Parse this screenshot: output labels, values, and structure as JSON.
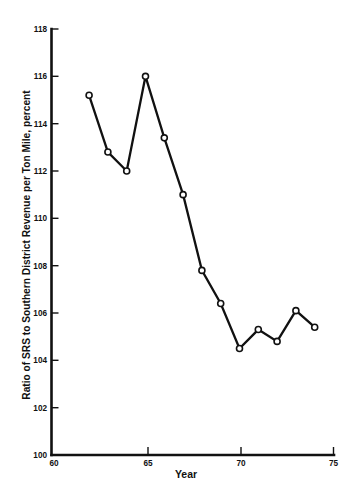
{
  "chart_data": {
    "type": "line",
    "title": "",
    "xlabel": "Year",
    "ylabel": "Ratio of SRS to Southern District Revenue per Ton Mile, percent",
    "x": [
      62,
      63,
      64,
      65,
      66,
      67,
      68,
      69,
      70,
      71,
      72,
      73,
      74
    ],
    "values": [
      115.2,
      112.8,
      112.0,
      116.0,
      113.4,
      111.0,
      107.8,
      106.4,
      104.5,
      105.3,
      104.8,
      106.1,
      105.4
    ],
    "series": [
      {
        "name": "Ratio of SRS to Southern District Revenue per Ton Mile",
        "values": [
          115.2,
          112.8,
          112.0,
          116.0,
          113.4,
          111.0,
          107.8,
          106.4,
          104.5,
          105.3,
          104.8,
          106.1,
          105.4
        ]
      }
    ],
    "xlim": [
      60,
      75
    ],
    "ylim": [
      100,
      118
    ],
    "xticks": [
      60,
      65,
      70,
      75
    ],
    "yticks": [
      100,
      102,
      104,
      106,
      108,
      110,
      112,
      114,
      116,
      118
    ],
    "xtick_labels": [
      "60",
      "65",
      "70",
      "75"
    ],
    "ytick_labels": [
      "100",
      "102",
      "104",
      "106",
      "108",
      "110",
      "112",
      "114",
      "116",
      "118"
    ],
    "grid": false,
    "legend": false,
    "legend_position": "none",
    "marker": "open-circle",
    "line_color": "#111111",
    "marker_fill": "#ffffff",
    "background": "#ffffff"
  },
  "axes": {
    "y_title": "Ratio of SRS to Southern District Revenue per Ton Mile, percent",
    "x_title": "Year"
  }
}
